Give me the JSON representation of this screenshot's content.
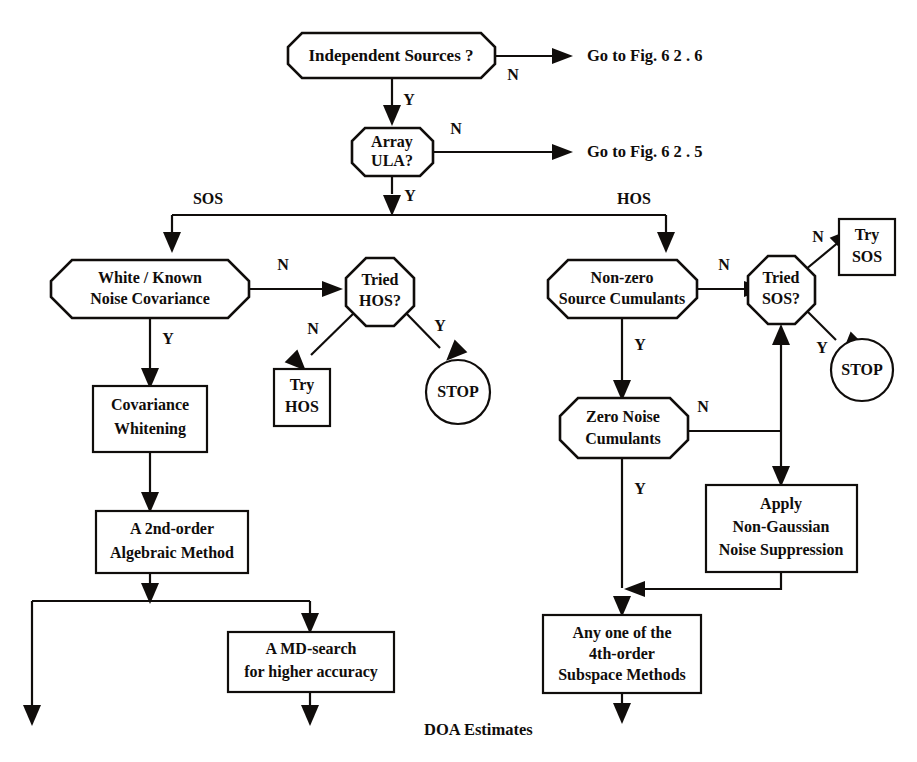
{
  "diagram": {
    "background_color": "#ffffff",
    "ink_color": "#100d0b"
  },
  "nodes": {
    "independent_sources": {
      "label_line1": "Independent Sources ?",
      "shape": "octagon"
    },
    "array_ula": {
      "label_line1": "Array",
      "label_line2": "ULA?",
      "shape": "octagon"
    },
    "white_known_noise": {
      "label_line1": "White / Known",
      "label_line2": "Noise Covariance",
      "shape": "octagon"
    },
    "tried_hos": {
      "label_line1": "Tried",
      "label_line2": "HOS?",
      "shape": "octagon"
    },
    "try_hos": {
      "label_line1": "Try",
      "label_line2": "HOS",
      "shape": "rectangle"
    },
    "stop_left": {
      "label_line1": "STOP",
      "shape": "circle"
    },
    "covariance_whitening": {
      "label_line1": "Covariance",
      "label_line2": "Whitening",
      "shape": "rectangle"
    },
    "second_order_algebraic": {
      "label_line1": "A 2nd-order",
      "label_line2": "Algebraic Method",
      "shape": "rectangle"
    },
    "md_search": {
      "label_line1": "A MD-search",
      "label_line2": "for higher accuracy",
      "shape": "rectangle"
    },
    "nonzero_source_cumulants": {
      "label_line1": "Non-zero",
      "label_line2": "Source Cumulants",
      "shape": "octagon"
    },
    "tried_sos": {
      "label_line1": "Tried",
      "label_line2": "SOS?",
      "shape": "octagon"
    },
    "try_sos": {
      "label_line1": "Try",
      "label_line2": "SOS",
      "shape": "rectangle"
    },
    "stop_right": {
      "label_line1": "STOP",
      "shape": "circle"
    },
    "zero_noise_cumulants": {
      "label_line1": "Zero Noise",
      "label_line2": "Cumulants",
      "shape": "octagon"
    },
    "apply_nongaussian": {
      "label_line1": "Apply",
      "label_line2": "Non-Gaussian",
      "label_line3": "Noise Suppression",
      "shape": "rectangle"
    },
    "fourth_order_subspace": {
      "label_line1": "Any one of the",
      "label_line2": "4th-order",
      "label_line3": "Subspace Methods",
      "shape": "rectangle"
    }
  },
  "edge_labels": {
    "independent_sources_no": "N",
    "independent_sources_yes": "Y",
    "array_ula_no": "N",
    "array_ula_yes": "Y",
    "branch_sos": "SOS",
    "branch_hos": "HOS",
    "white_known_noise_no": "N",
    "white_known_noise_yes": "Y",
    "tried_hos_no": "N",
    "tried_hos_yes": "Y",
    "nonzero_cumulants_no": "N",
    "nonzero_cumulants_yes": "Y",
    "tried_sos_no": "N",
    "tried_sos_yes": "Y",
    "zero_noise_no": "N",
    "zero_noise_yes": "Y"
  },
  "annotations": {
    "goto_fig_626": "Go to Fig. 6 2 . 6",
    "goto_fig_625": "Go to Fig. 6 2 . 5",
    "doa_estimates": "DOA Estimates"
  }
}
